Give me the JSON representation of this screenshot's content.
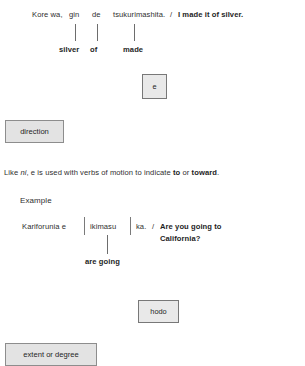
{
  "example_one": {
    "sentence_parts": {
      "kore_wa": "Kore wa,",
      "gin": "gin",
      "de": "de",
      "tsukurimashita": "tsukurimashita.",
      "separator": "/",
      "translation": "I made it of silver."
    },
    "glosses": {
      "gin": "silver",
      "de": "of",
      "tsukurimashita": "made"
    }
  },
  "particle_e": {
    "symbol": "e",
    "definition": "direction",
    "explanation_prefix": "Like ",
    "explanation_italic": "ni",
    "explanation_suffix": ", e is used with verbs of motion to indicate ",
    "explanation_bold_one": "to",
    "explanation_middle": " or ",
    "explanation_bold_two": "toward",
    "explanation_end": "."
  },
  "example_label": "Example",
  "example_two": {
    "sentence_parts": {
      "kariforunia_e": "Kariforunia e",
      "ikimasu": "ikimasu",
      "ka": "ka.",
      "separator": "/",
      "translation_line_one": "Are you going to",
      "translation_line_two": "California?"
    },
    "glosses": {
      "ikimasu": "are going"
    }
  },
  "particle_hodo": {
    "symbol": "hodo",
    "definition": "extent or degree"
  }
}
